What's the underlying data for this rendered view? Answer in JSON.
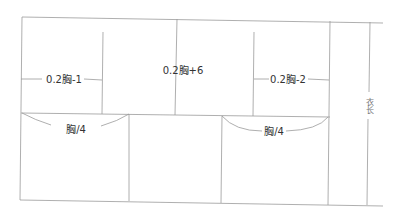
{
  "diagram": {
    "type": "garment-pattern",
    "labels": {
      "left_width": "0.2胸-1",
      "center_width": "0.2胸+6",
      "right_width": "0.2胸-2",
      "left_chest": "胸/4",
      "right_chest": "胸/4",
      "length": "衣长"
    },
    "colors": {
      "line": "#9a9a9a",
      "text": "#333333"
    }
  }
}
